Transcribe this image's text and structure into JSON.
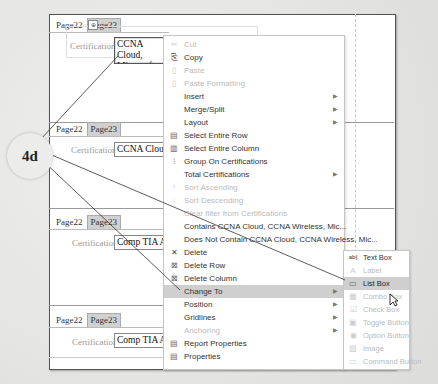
{
  "callout": {
    "label": "4d"
  },
  "sections": [
    {
      "tabs": [
        "Page22",
        "Page23"
      ],
      "active_tab": 1,
      "label": "Certifications",
      "value_line1": "CCNA Cloud,",
      "value_line2": "Microsoft MC"
    },
    {
      "tabs": [
        "Page22",
        "Page23"
      ],
      "active_tab": 1,
      "label": "Certifications",
      "value_line1": "CCNA Cloud,"
    },
    {
      "tabs": [
        "Page22",
        "Page23"
      ],
      "active_tab": 1,
      "label": "Certifications",
      "value_line1": "Comp TIA A+"
    },
    {
      "tabs": [
        "Page22",
        "Page23"
      ],
      "active_tab": 1,
      "label": "Certifications",
      "value_line1": "Comp TIA A+"
    }
  ],
  "context_menu": {
    "items": [
      {
        "label": "Cut",
        "icon": "scissors-icon",
        "glyph": "✂",
        "disabled": true
      },
      {
        "label": "Copy",
        "icon": "copy-icon",
        "glyph": "⎘",
        "disabled": false
      },
      {
        "label": "Paste",
        "icon": "paste-icon",
        "glyph": "📋",
        "disabled": true
      },
      {
        "label": "Paste Formatting",
        "icon": "paste-formatting-icon",
        "glyph": "🖌",
        "disabled": true
      },
      {
        "label": "Insert",
        "submenu": true
      },
      {
        "label": "Merge/Split",
        "submenu": true
      },
      {
        "label": "Layout",
        "submenu": true
      },
      {
        "label": "Select Entire Row",
        "icon": "select-row-icon",
        "glyph": "▤"
      },
      {
        "label": "Select Entire Column",
        "icon": "select-column-icon",
        "glyph": "▥"
      },
      {
        "label": "Group On Certifications",
        "icon": "group-icon",
        "glyph": "⁝≡"
      },
      {
        "label": "Total Certifications",
        "submenu": true
      },
      {
        "label": "Sort Ascending",
        "icon": "sort-ascending-icon",
        "glyph": "↑",
        "disabled": true
      },
      {
        "label": "Sort Descending",
        "icon": "sort-descending-icon",
        "glyph": "↓",
        "disabled": true
      },
      {
        "label": "Clear filter from Certifications",
        "disabled": true
      },
      {
        "label": "Contains CCNA Cloud, CCNA Wireless, Mic..."
      },
      {
        "label": "Does Not Contain CCNA Cloud, CCNA Wireless, Mic..."
      },
      {
        "label": "Delete",
        "icon": "delete-icon",
        "glyph": "✕"
      },
      {
        "label": "Delete Row",
        "icon": "delete-row-icon",
        "glyph": "⊠"
      },
      {
        "label": "Delete Column",
        "icon": "delete-column-icon",
        "glyph": "⊠"
      },
      {
        "label": "Change To",
        "submenu": true,
        "highlighted": true
      },
      {
        "label": "Position",
        "submenu": true
      },
      {
        "label": "Gridlines",
        "submenu": true
      },
      {
        "label": "Anchoring",
        "submenu": true,
        "disabled": true
      },
      {
        "label": "Report Properties",
        "icon": "report-properties-icon",
        "glyph": "▤"
      },
      {
        "label": "Properties",
        "icon": "properties-icon",
        "glyph": "▤"
      }
    ]
  },
  "change_to_submenu": {
    "items": [
      {
        "label": "Text Box",
        "icon": "text-box-icon",
        "glyph": "ab"
      },
      {
        "label": "Label",
        "icon": "label-icon",
        "glyph": "A",
        "disabled": true
      },
      {
        "label": "List Box",
        "icon": "list-box-icon",
        "glyph": "▭",
        "highlighted": true
      },
      {
        "label": "Combo Box",
        "icon": "combo-box-icon",
        "glyph": "▦",
        "disabled": true
      },
      {
        "label": "Check Box",
        "icon": "check-box-icon",
        "glyph": "☑",
        "disabled": true
      },
      {
        "label": "Toggle Button",
        "icon": "toggle-button-icon",
        "glyph": "▣",
        "disabled": true
      },
      {
        "label": "Option Button",
        "icon": "option-button-icon",
        "glyph": "◉",
        "disabled": true
      },
      {
        "label": "Image",
        "icon": "image-icon",
        "glyph": "▨",
        "disabled": true
      },
      {
        "label": "Command Button",
        "icon": "command-button-icon",
        "glyph": "▭",
        "disabled": true
      }
    ]
  }
}
